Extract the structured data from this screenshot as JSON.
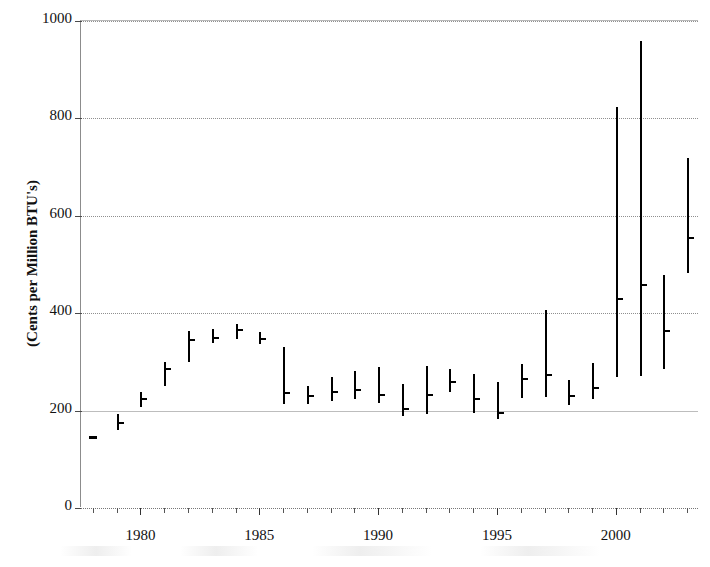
{
  "chart_data": {
    "type": "ohlc",
    "title": "",
    "xlabel": "",
    "ylabel": "(Cents per Million BTU's)",
    "ylim": [
      0,
      1000
    ],
    "xlim": [
      1977.5,
      2003.5
    ],
    "y_ticks": [
      0,
      200,
      400,
      600,
      800,
      1000
    ],
    "x_ticks_major": [
      1980,
      1985,
      1990,
      1995,
      2000
    ],
    "x_tick_labels": [
      "1980",
      "1985",
      "1990",
      "1995",
      "2000"
    ],
    "x_minor_tick_years": [
      1978,
      1979,
      1980,
      1981,
      1982,
      1983,
      1984,
      1985,
      1986,
      1987,
      1988,
      1989,
      1990,
      1991,
      1992,
      1993,
      1994,
      1995,
      1996,
      1997,
      1998,
      1999,
      2000,
      2001,
      2002,
      2003
    ],
    "grid": true,
    "grid_axis": "y",
    "legend": false,
    "series_name": "Price range per year",
    "point_marker": "close-tick-right",
    "color": "#000000",
    "points": [
      {
        "year": 1978,
        "high": 150,
        "low": 146,
        "close": 148
      },
      {
        "year": 1979,
        "high": 192,
        "low": 160,
        "close": 176
      },
      {
        "year": 1980,
        "high": 238,
        "low": 208,
        "close": 226
      },
      {
        "year": 1981,
        "high": 300,
        "low": 250,
        "close": 288
      },
      {
        "year": 1982,
        "high": 364,
        "low": 300,
        "close": 348
      },
      {
        "year": 1983,
        "high": 368,
        "low": 338,
        "close": 352
      },
      {
        "year": 1984,
        "high": 378,
        "low": 348,
        "close": 368
      },
      {
        "year": 1985,
        "high": 362,
        "low": 336,
        "close": 350
      },
      {
        "year": 1986,
        "high": 330,
        "low": 214,
        "close": 238
      },
      {
        "year": 1987,
        "high": 250,
        "low": 214,
        "close": 232
      },
      {
        "year": 1988,
        "high": 268,
        "low": 220,
        "close": 240
      },
      {
        "year": 1989,
        "high": 282,
        "low": 224,
        "close": 244
      },
      {
        "year": 1990,
        "high": 290,
        "low": 216,
        "close": 234
      },
      {
        "year": 1991,
        "high": 254,
        "low": 188,
        "close": 206
      },
      {
        "year": 1992,
        "high": 292,
        "low": 194,
        "close": 234
      },
      {
        "year": 1993,
        "high": 286,
        "low": 238,
        "close": 260
      },
      {
        "year": 1994,
        "high": 276,
        "low": 196,
        "close": 226
      },
      {
        "year": 1995,
        "high": 258,
        "low": 182,
        "close": 198
      },
      {
        "year": 1996,
        "high": 296,
        "low": 226,
        "close": 266
      },
      {
        "year": 1997,
        "high": 406,
        "low": 228,
        "close": 276
      },
      {
        "year": 1998,
        "high": 262,
        "low": 212,
        "close": 232
      },
      {
        "year": 1999,
        "high": 298,
        "low": 224,
        "close": 248
      },
      {
        "year": 2000,
        "high": 824,
        "low": 268,
        "close": 432
      },
      {
        "year": 2001,
        "high": 958,
        "low": 272,
        "close": 460
      },
      {
        "year": 2002,
        "high": 478,
        "low": 286,
        "close": 366
      },
      {
        "year": 2003,
        "high": 718,
        "low": 482,
        "close": 556
      }
    ]
  }
}
